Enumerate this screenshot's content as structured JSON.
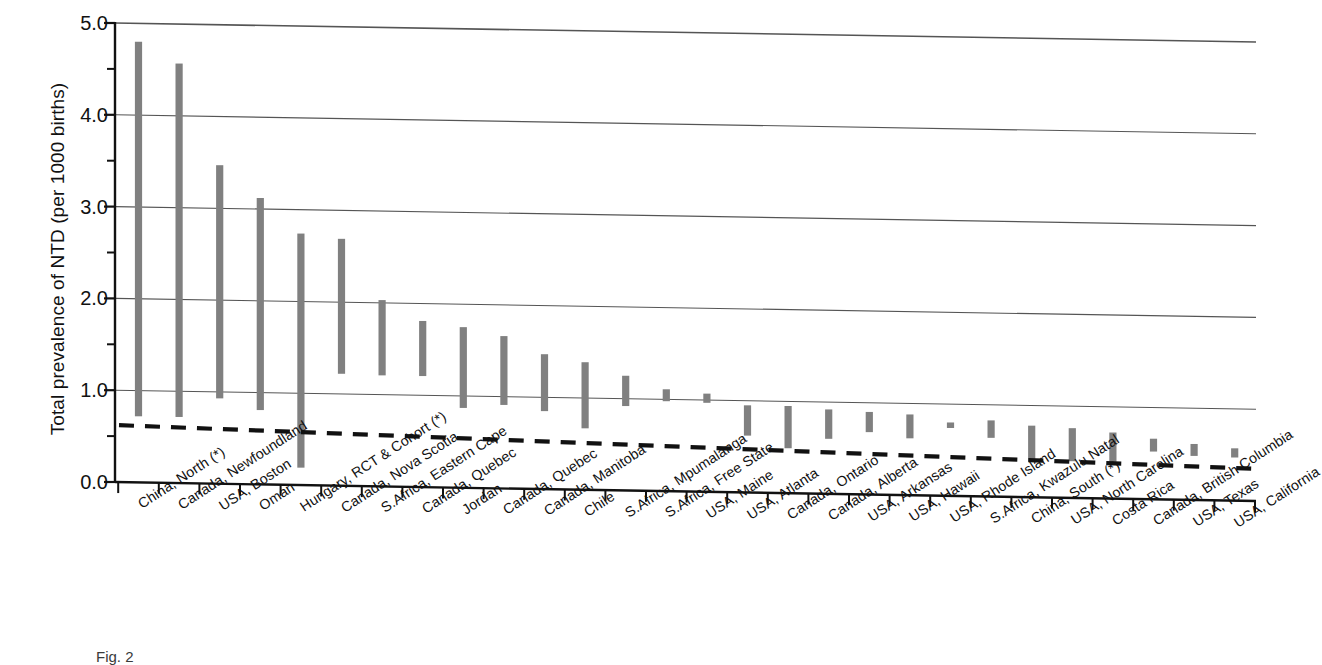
{
  "figure": {
    "caption_fragment": "Fig. 2"
  },
  "chart_data": {
    "type": "bar",
    "title": "",
    "subtitle": "",
    "xlabel": "",
    "ylabel": "Total prevalence of NTD (per 1000 births)",
    "ylim": [
      0.0,
      5.0
    ],
    "ytick_labels": [
      "0.0",
      "1.0",
      "2.0",
      "3.0",
      "4.0",
      "5.0"
    ],
    "ytick_values": [
      0.0,
      1.0,
      2.0,
      3.0,
      4.0,
      5.0
    ],
    "yminor_values": [
      0.5,
      1.5,
      2.5,
      3.5,
      4.5
    ],
    "grid": "horizontal",
    "legend": "none",
    "bar_style": "range-bar",
    "bar_color": "#808080",
    "reference_line": {
      "label": "",
      "style": "dashed",
      "color": "#111111",
      "value_left": 0.62,
      "value_right": 0.35
    },
    "categories": [
      "China, North (*)",
      "Canada, Newfoundland",
      "USA, Boston",
      "Oman",
      "Hungary, RCT & Cohort (*)",
      "Canada, Nova Scotia",
      "S.Africa, Eastern Cape",
      "Canada, Quebec",
      "Jordan",
      "Canada, Quebec",
      "Canada, Manitoba",
      "Chile",
      "S.Africa, Mpumalanga",
      "S.Africa, Free State",
      "USA, Maine",
      "USA, Atlanta",
      "Canada, Ontario",
      "Canada, Alberta",
      "USA, Arkansas",
      "USA, Hawaii",
      "USA, Rhode Island",
      "S.Africa, Kwazulu Natal",
      "China, South (*)",
      "USA, North Carolina",
      "Costa Rica",
      "Canada, British Columbia",
      "USA, Texas",
      "USA, California"
    ],
    "high_values": [
      4.8,
      4.57,
      3.47,
      3.12,
      2.74,
      2.69,
      2.03,
      1.81,
      1.75,
      1.66,
      1.47,
      1.39,
      1.25,
      1.11,
      1.07,
      0.95,
      0.95,
      0.92,
      0.9,
      0.88,
      0.8,
      0.83,
      0.78,
      0.76,
      0.72,
      0.66,
      0.61,
      0.57
    ],
    "low_values": [
      0.72,
      0.72,
      0.93,
      0.81,
      0.19,
      1.22,
      1.21,
      1.21,
      0.87,
      0.91,
      0.85,
      0.67,
      0.92,
      0.98,
      0.97,
      0.62,
      0.49,
      0.6,
      0.68,
      0.62,
      0.74,
      0.64,
      0.39,
      0.4,
      0.4,
      0.52,
      0.48,
      0.47
    ]
  }
}
